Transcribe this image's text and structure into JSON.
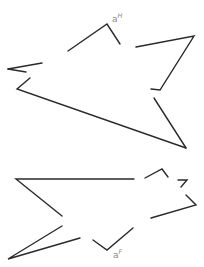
{
  "diagram": {
    "type": "fragmented polygon outlines",
    "stroke_color": "#2a2a2a",
    "label_color": "#8a8a8a",
    "figures": [
      {
        "id": "figure-H",
        "label": {
          "base": "a",
          "superscript": "H",
          "x": 112,
          "y": 22
        },
        "segments": [
          [
            [
              68,
              51
            ],
            [
              107,
              24
            ],
            [
              120,
              44
            ]
          ],
          [
            [
              136,
              47
            ],
            [
              194,
              36
            ],
            [
              160,
              90
            ],
            [
              151,
              89
            ]
          ],
          [
            [
              154,
              98
            ],
            [
              186,
              148
            ]
          ],
          [
            [
              186,
              148
            ],
            [
              17,
              89
            ],
            [
              30,
              78
            ]
          ],
          [
            [
              8,
              69
            ],
            [
              42,
              63
            ]
          ],
          [
            [
              8,
              69
            ],
            [
              26,
              72
            ]
          ]
        ]
      },
      {
        "id": "figure-F",
        "label": {
          "base": "a",
          "superscript": "F",
          "x": 113,
          "y": 258
        },
        "segments": [
          [
            [
              135,
              178
            ]
          ],
          [
            [
              145,
              178
            ],
            [
              162,
              169
            ],
            [
              168,
              177
            ]
          ],
          [
            [
              178,
              180
            ],
            [
              187,
              180
            ],
            [
              181,
              187
            ]
          ],
          [
            [
              186,
              195
            ],
            [
              196,
              205
            ],
            [
              151,
              218
            ]
          ],
          [
            [
              133,
              228
            ],
            [
              107,
              250
            ],
            [
              93,
              240
            ]
          ],
          [
            [
              80,
              238
            ],
            [
              8,
              259
            ],
            [
              62,
              226
            ]
          ],
          [
            [
              62,
              216
            ],
            [
              16,
              179
            ],
            [
              134,
              179
            ]
          ]
        ]
      }
    ]
  }
}
